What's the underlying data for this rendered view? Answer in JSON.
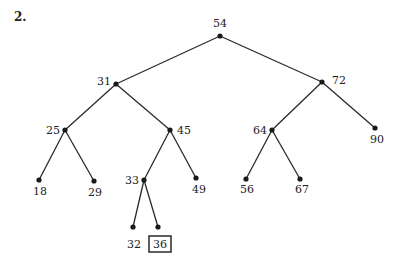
{
  "problem_number": "2.",
  "tree": {
    "nodes": [
      {
        "id": "54",
        "label": "54",
        "x": 220,
        "y": 36,
        "lx": 220,
        "ly": 27,
        "anchor": "middle"
      },
      {
        "id": "31",
        "label": "31",
        "x": 116,
        "y": 84,
        "lx": 111,
        "ly": 85,
        "anchor": "end"
      },
      {
        "id": "72",
        "label": "72",
        "x": 322,
        "y": 82,
        "lx": 332,
        "ly": 84,
        "anchor": "start"
      },
      {
        "id": "25",
        "label": "25",
        "x": 65,
        "y": 130,
        "lx": 60,
        "ly": 134,
        "anchor": "end"
      },
      {
        "id": "45",
        "label": "45",
        "x": 170,
        "y": 130,
        "lx": 177,
        "ly": 134,
        "anchor": "start"
      },
      {
        "id": "64",
        "label": "64",
        "x": 272,
        "y": 130,
        "lx": 267,
        "ly": 134,
        "anchor": "end"
      },
      {
        "id": "90",
        "label": "90",
        "x": 375,
        "y": 128,
        "lx": 377,
        "ly": 143,
        "anchor": "middle"
      },
      {
        "id": "18",
        "label": "18",
        "x": 39,
        "y": 180,
        "lx": 40,
        "ly": 195,
        "anchor": "middle"
      },
      {
        "id": "29",
        "label": "29",
        "x": 94,
        "y": 181,
        "lx": 95,
        "ly": 196,
        "anchor": "middle"
      },
      {
        "id": "33",
        "label": "33",
        "x": 144,
        "y": 180,
        "lx": 139,
        "ly": 184,
        "anchor": "end"
      },
      {
        "id": "49",
        "label": "49",
        "x": 196,
        "y": 178,
        "lx": 199,
        "ly": 193,
        "anchor": "middle"
      },
      {
        "id": "56",
        "label": "56",
        "x": 246,
        "y": 179,
        "lx": 247,
        "ly": 193,
        "anchor": "middle"
      },
      {
        "id": "67",
        "label": "67",
        "x": 300,
        "y": 179,
        "lx": 302,
        "ly": 193,
        "anchor": "middle"
      },
      {
        "id": "32",
        "label": "32",
        "x": 133,
        "y": 227,
        "lx": 134,
        "ly": 248,
        "anchor": "middle"
      },
      {
        "id": "36",
        "label": "36",
        "x": 158,
        "y": 227,
        "lx": 160,
        "ly": 248,
        "anchor": "middle",
        "highlighted": true
      }
    ],
    "edges": [
      [
        "54",
        "31"
      ],
      [
        "54",
        "72"
      ],
      [
        "31",
        "25"
      ],
      [
        "31",
        "45"
      ],
      [
        "72",
        "64"
      ],
      [
        "72",
        "90"
      ],
      [
        "25",
        "18"
      ],
      [
        "25",
        "29"
      ],
      [
        "45",
        "33"
      ],
      [
        "45",
        "49"
      ],
      [
        "64",
        "56"
      ],
      [
        "64",
        "67"
      ],
      [
        "33",
        "32"
      ],
      [
        "33",
        "36"
      ]
    ]
  }
}
